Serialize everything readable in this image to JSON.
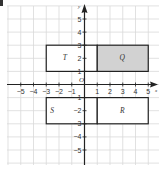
{
  "diagram": {
    "type": "coordinate-grid",
    "x_range": [
      -6,
      6
    ],
    "y_range": [
      -6,
      6
    ],
    "origin_label": "O",
    "x_axis_label": "x",
    "y_axis_label": "y",
    "x_ticks": [
      {
        "v": -5,
        "label": "−5"
      },
      {
        "v": -4,
        "label": "−4"
      },
      {
        "v": -3,
        "label": "−3"
      },
      {
        "v": -2,
        "label": "−2"
      },
      {
        "v": -1,
        "label": "−1"
      },
      {
        "v": 1,
        "label": "1"
      },
      {
        "v": 2,
        "label": "2"
      },
      {
        "v": 3,
        "label": "3"
      },
      {
        "v": 4,
        "label": "4"
      },
      {
        "v": 5,
        "label": "5"
      }
    ],
    "y_ticks": [
      {
        "v": 5,
        "label": "5"
      },
      {
        "v": 4,
        "label": "4"
      },
      {
        "v": 3,
        "label": "3"
      },
      {
        "v": 2,
        "label": "2"
      },
      {
        "v": 1,
        "label": "1"
      },
      {
        "v": -1,
        "label": "−1"
      },
      {
        "v": -2,
        "label": "−2"
      },
      {
        "v": -3,
        "label": "−3"
      },
      {
        "v": -4,
        "label": "−4"
      },
      {
        "v": -5,
        "label": "−5"
      }
    ],
    "rectangles": [
      {
        "label": "T",
        "x1": -3,
        "y1": 1,
        "x2": 1,
        "y2": 3,
        "fill": "#ffffff"
      },
      {
        "label": "Q",
        "x1": 1,
        "y1": 1,
        "x2": 5,
        "y2": 3,
        "fill": "#d2d2d2"
      },
      {
        "label": "S",
        "x1": -3,
        "y1": -3,
        "x2": 1,
        "y2": -1,
        "fill": "#ffffff"
      },
      {
        "label": "R",
        "x1": 1,
        "y1": -3,
        "x2": 5,
        "y2": -1,
        "fill": "#ffffff"
      }
    ],
    "colors": {
      "grid": "#d9d9d9",
      "axis": "#222222",
      "rect_stroke": "#222222",
      "shaded": "#d2d2d2"
    }
  }
}
